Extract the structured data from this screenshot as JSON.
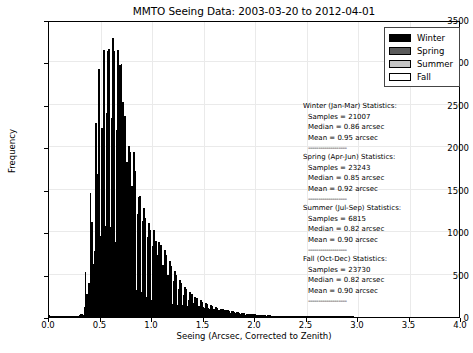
{
  "chart_data": {
    "type": "bar",
    "subtype": "grouped-histogram",
    "title": "MMTO Seeing Data: 2003-03-20 to 2012-04-01",
    "xlabel": "Seeing (Arcsec, Corrected to Zenith)",
    "ylabel": "Frequency",
    "xlim": [
      0.0,
      4.0
    ],
    "ylim": [
      0,
      3500
    ],
    "xticks": [
      "0.0",
      "0.5",
      "1.0",
      "1.5",
      "2.0",
      "2.5",
      "3.0",
      "3.5",
      "4.0"
    ],
    "xtick_values": [
      0.0,
      0.5,
      1.0,
      1.5,
      2.0,
      2.5,
      3.0,
      3.5,
      4.0
    ],
    "yticks": [
      "0",
      "500",
      "1000",
      "1500",
      "2000",
      "2500",
      "3000",
      "3500"
    ],
    "ytick_values": [
      0,
      500,
      1000,
      1500,
      2000,
      2500,
      3000,
      3500
    ],
    "grid": true,
    "legend_position": "upper right",
    "bin_width": 0.05,
    "bin_starts": [
      0.0,
      0.05,
      0.1,
      0.15,
      0.2,
      0.25,
      0.3,
      0.35,
      0.4,
      0.45,
      0.5,
      0.55,
      0.6,
      0.65,
      0.7,
      0.75,
      0.8,
      0.85,
      0.9,
      0.95,
      1.0,
      1.05,
      1.1,
      1.15,
      1.2,
      1.25,
      1.3,
      1.35,
      1.4,
      1.45,
      1.5,
      1.55,
      1.6,
      1.65,
      1.7,
      1.75,
      1.8,
      1.85,
      1.9,
      1.95,
      2.0,
      2.05,
      2.1,
      2.15,
      2.2,
      2.25,
      2.3,
      2.35,
      2.4,
      2.45,
      2.5,
      2.55,
      2.6,
      2.65,
      2.7,
      2.75,
      2.8,
      2.85,
      2.9,
      2.95
    ],
    "series": [
      {
        "name": "Winter",
        "color": "#000000",
        "values": [
          20,
          4,
          3,
          3,
          6,
          12,
          35,
          530,
          1465,
          2290,
          2230,
          2400,
          2340,
          2200,
          2980,
          1830,
          1540,
          1210,
          1130,
          940,
          840,
          730,
          610,
          500,
          430,
          330,
          260,
          200,
          160,
          130,
          110,
          95,
          80,
          70,
          60,
          50,
          42,
          35,
          28,
          22,
          18,
          15,
          12,
          10,
          8,
          7,
          6,
          5,
          4,
          3,
          3,
          2,
          2,
          2,
          1,
          1,
          1,
          1,
          1,
          0
        ]
      },
      {
        "name": "Spring",
        "color": "#5a5a5a",
        "values": [
          6,
          3,
          3,
          4,
          7,
          14,
          40,
          270,
          1115,
          1690,
          2230,
          3140,
          3290,
          3150,
          2530,
          2020,
          1940,
          1420,
          1280,
          1110,
          1020,
          880,
          790,
          660,
          545,
          440,
          350,
          300,
          240,
          200,
          170,
          145,
          120,
          100,
          85,
          72,
          60,
          50,
          40,
          33,
          27,
          22,
          18,
          15,
          12,
          10,
          8,
          7,
          5,
          4,
          3,
          3,
          2,
          2,
          1,
          1,
          1,
          1,
          1,
          0
        ]
      },
      {
        "name": "Summer",
        "color": "#c4c4c4",
        "values": [
          4,
          2,
          2,
          3,
          5,
          9,
          25,
          395,
          620,
          2920,
          3150,
          3160,
          3140,
          2970,
          2370,
          1950,
          1720,
          1430,
          1170,
          1020,
          900,
          845,
          735,
          600,
          495,
          400,
          330,
          270,
          220,
          180,
          155,
          130,
          110,
          90,
          78,
          65,
          55,
          45,
          36,
          30,
          24,
          20,
          16,
          13,
          11,
          9,
          7,
          6,
          5,
          4,
          3,
          2,
          2,
          2,
          1,
          1,
          1,
          1,
          1,
          0
        ]
      },
      {
        "name": "Fall",
        "color": "#ffffff",
        "values": [
          8,
          3,
          4,
          6,
          12,
          28,
          115,
          200,
          780,
          960,
          1070,
          1060,
          880,
          670,
          490,
          340,
          320,
          300,
          240,
          200,
          175,
          170,
          160,
          150,
          145,
          140,
          135,
          130,
          125,
          115,
          110,
          100,
          88,
          78,
          68,
          60,
          52,
          45,
          38,
          32,
          27,
          22,
          18,
          15,
          12,
          10,
          8,
          7,
          6,
          5,
          4,
          3,
          3,
          2,
          2,
          1,
          1,
          1,
          1,
          0
        ]
      }
    ]
  },
  "legend": {
    "items": [
      {
        "label": "Winter",
        "key": "winter"
      },
      {
        "label": "Spring",
        "key": "spring"
      },
      {
        "label": "Summer",
        "key": "summer"
      },
      {
        "label": "Fall",
        "key": "fall"
      }
    ]
  },
  "annotations": {
    "rule": "-------------------",
    "blocks": [
      {
        "heading": "Winter (Jan-Mar) Statistics:",
        "samples": "Samples = 21007",
        "median": "Median =  0.86 arcsec",
        "mean": "Mean =  0.95 arcsec"
      },
      {
        "heading": "Spring (Apr-Jun) Statistics:",
        "samples": "Samples = 23243",
        "median": "Median =  0.85 arcsec",
        "mean": "Mean =  0.92 arcsec"
      },
      {
        "heading": "Summer (Jul-Sep) Statistics:",
        "samples": "Samples = 6815",
        "median": "Median =  0.82 arcsec",
        "mean": "Mean =  0.90 arcsec"
      },
      {
        "heading": "Fall (Oct-Dec) Statistics:",
        "samples": "Samples = 23730",
        "median": "Median =  0.82 arcsec",
        "mean": "Mean =  0.90 arcsec"
      }
    ]
  }
}
